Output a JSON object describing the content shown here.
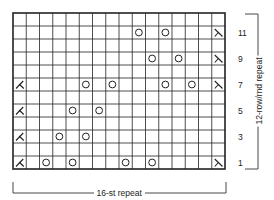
{
  "chart": {
    "columns": 16,
    "rows": 12,
    "grid": {
      "left": 13,
      "top": 13,
      "width": 212,
      "height": 156
    },
    "line_color": "#222222",
    "background": "#ffffff",
    "row_labels": [
      "1",
      "3",
      "5",
      "7",
      "9",
      "11"
    ],
    "row_label_rows": [
      1,
      3,
      5,
      7,
      9,
      11
    ],
    "repeat_vertical_label": "12-row/rnd repeat",
    "repeat_horizontal_label": "16-st repeat",
    "symbols": {
      "yo": "yarn-over-circle",
      "left": "left-decrease-symbol",
      "right": "right-decrease-symbol"
    },
    "cells": [
      {
        "row": 1,
        "col": 1,
        "symbol": "left"
      },
      {
        "row": 1,
        "col": 3,
        "symbol": "yo"
      },
      {
        "row": 1,
        "col": 5,
        "symbol": "yo"
      },
      {
        "row": 1,
        "col": 9,
        "symbol": "yo"
      },
      {
        "row": 1,
        "col": 11,
        "symbol": "yo"
      },
      {
        "row": 1,
        "col": 16,
        "symbol": "right"
      },
      {
        "row": 3,
        "col": 1,
        "symbol": "left"
      },
      {
        "row": 3,
        "col": 4,
        "symbol": "yo"
      },
      {
        "row": 3,
        "col": 6,
        "symbol": "yo"
      },
      {
        "row": 5,
        "col": 1,
        "symbol": "left"
      },
      {
        "row": 5,
        "col": 5,
        "symbol": "yo"
      },
      {
        "row": 5,
        "col": 7,
        "symbol": "yo"
      },
      {
        "row": 7,
        "col": 1,
        "symbol": "left"
      },
      {
        "row": 7,
        "col": 6,
        "symbol": "yo"
      },
      {
        "row": 7,
        "col": 8,
        "symbol": "yo"
      },
      {
        "row": 7,
        "col": 12,
        "symbol": "yo"
      },
      {
        "row": 7,
        "col": 14,
        "symbol": "yo"
      },
      {
        "row": 7,
        "col": 16,
        "symbol": "right"
      },
      {
        "row": 9,
        "col": 11,
        "symbol": "yo"
      },
      {
        "row": 9,
        "col": 13,
        "symbol": "yo"
      },
      {
        "row": 9,
        "col": 16,
        "symbol": "right"
      },
      {
        "row": 11,
        "col": 10,
        "symbol": "yo"
      },
      {
        "row": 11,
        "col": 12,
        "symbol": "yo"
      },
      {
        "row": 11,
        "col": 16,
        "symbol": "right"
      }
    ]
  }
}
